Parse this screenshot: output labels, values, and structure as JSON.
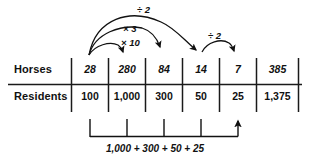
{
  "diagram": {
    "rows": [
      {
        "key": "horses",
        "label": "Horses",
        "cells": [
          "28",
          "280",
          "84",
          "14",
          "7",
          "385"
        ]
      },
      {
        "key": "residents",
        "label": "Residents",
        "cells": [
          "100",
          "1,000",
          "300",
          "50",
          "25",
          "1,375"
        ]
      }
    ],
    "operations": [
      {
        "key": "div2_top",
        "label": "÷ 2",
        "from": "28",
        "to": "14"
      },
      {
        "key": "mult3",
        "label": "× 3",
        "from": "28",
        "to": "84"
      },
      {
        "key": "mult10",
        "label": "× 10",
        "from": "28",
        "to": "280"
      },
      {
        "key": "div2_right",
        "label": "÷ 2",
        "from": "14",
        "to": "7"
      }
    ],
    "sum_equation": "1,000 + 300 + 50 + 25",
    "colors": {
      "ink": "#111111",
      "rule": "#1a1a1a",
      "background": "#ffffff"
    }
  }
}
